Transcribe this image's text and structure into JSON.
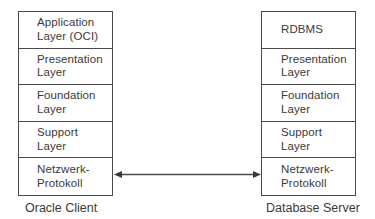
{
  "diagram": {
    "type": "layered-architecture",
    "client": {
      "caption": "Oracle Client",
      "layers": [
        {
          "line1": "Application",
          "line2": "Layer (OCI)"
        },
        {
          "line1": "Presentation",
          "line2": "Layer"
        },
        {
          "line1": "Foundation",
          "line2": "Layer"
        },
        {
          "line1": "Support",
          "line2": "Layer"
        },
        {
          "line1": "Netzwerk-",
          "line2": "Protokoll"
        }
      ]
    },
    "server": {
      "caption": "Database Server",
      "layers": [
        {
          "line1": "RDBMS",
          "line2": ""
        },
        {
          "line1": "Presentation",
          "line2": "Layer"
        },
        {
          "line1": "Foundation",
          "line2": "Layer"
        },
        {
          "line1": "Support",
          "line2": "Layer"
        },
        {
          "line1": "Netzwerk-",
          "line2": "Protokoll"
        }
      ]
    },
    "connector": {
      "from": "client.Netzwerk-Protokoll",
      "to": "server.Netzwerk-Protokoll",
      "direction": "bidirectional"
    },
    "colors": {
      "line": "#4a4a4a",
      "text": "#3a3a3a",
      "background": "#ffffff"
    }
  }
}
